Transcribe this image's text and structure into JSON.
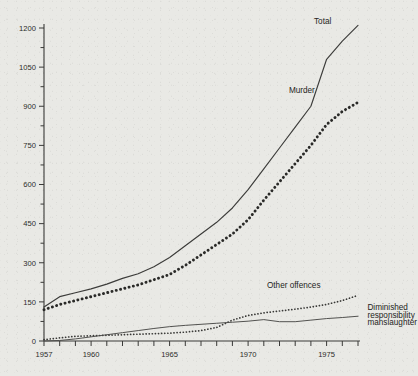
{
  "chart_data": {
    "type": "line",
    "title": "",
    "subtitle": "",
    "xlabel": "",
    "ylabel": "",
    "xlim": [
      1957,
      1977
    ],
    "ylim": [
      0,
      1200
    ],
    "grid": false,
    "legend_position": "inline-annotations",
    "y_ticks_major": [
      0,
      150,
      300,
      450,
      600,
      750,
      900,
      1050,
      1200
    ],
    "y_tick_labels": [
      "0",
      "150",
      "300",
      "450",
      "600",
      "750",
      "900",
      "1050",
      "1200"
    ],
    "y_ticks_minor": [
      75,
      225,
      375,
      525,
      675,
      825,
      975,
      1125
    ],
    "x_ticks": [
      1957,
      1958,
      1959,
      1960,
      1961,
      1962,
      1963,
      1964,
      1965,
      1966,
      1967,
      1968,
      1969,
      1970,
      1971,
      1972,
      1973,
      1974,
      1975,
      1976,
      1977
    ],
    "x_tick_labels": [
      {
        "year": 1957,
        "label": "1957"
      },
      {
        "year": 1960,
        "label": "1960"
      },
      {
        "year": 1965,
        "label": "1965"
      },
      {
        "year": 1970,
        "label": "1970"
      },
      {
        "year": 1975,
        "label": "1975"
      }
    ],
    "x": [
      1957,
      1958,
      1959,
      1960,
      1961,
      1962,
      1963,
      1964,
      1965,
      1966,
      1967,
      1968,
      1969,
      1970,
      1971,
      1972,
      1973,
      1974,
      1975,
      1976,
      1977
    ],
    "series": [
      {
        "name": "Total",
        "label": "Total",
        "style": "solid",
        "color": "#3c3c3a",
        "values": [
          130,
          170,
          185,
          200,
          218,
          240,
          258,
          285,
          320,
          365,
          410,
          455,
          510,
          580,
          660,
          740,
          820,
          900,
          1080,
          1150,
          1210
        ]
      },
      {
        "name": "Murder",
        "label": "Murder",
        "style": "thick-dotted",
        "color": "#2a2a28",
        "values": [
          120,
          140,
          155,
          170,
          185,
          200,
          215,
          235,
          255,
          290,
          330,
          370,
          410,
          465,
          540,
          610,
          680,
          750,
          830,
          880,
          915
        ]
      },
      {
        "name": "Other offences",
        "label": "Other offences",
        "style": "fine-dotted",
        "color": "#393937",
        "values": [
          5,
          12,
          18,
          20,
          22,
          24,
          26,
          28,
          30,
          34,
          40,
          52,
          80,
          98,
          108,
          115,
          122,
          130,
          140,
          155,
          175
        ]
      },
      {
        "name": "Diminished responsibility manslaughter",
        "label": "Diminished responsibility manslaughter",
        "label_lines": [
          "Diminished",
          "responsibility",
          "manslaughter"
        ],
        "style": "thin-solid",
        "color": "#4a4a48",
        "values": [
          0,
          2,
          8,
          16,
          24,
          32,
          40,
          48,
          55,
          60,
          64,
          68,
          72,
          76,
          82,
          74,
          74,
          80,
          86,
          90,
          95
        ]
      }
    ],
    "annotations": [
      {
        "text": "Total",
        "x": 1974.2,
        "y": 1215
      },
      {
        "text": "Murder",
        "x": 1972.6,
        "y": 950
      },
      {
        "text": "Other offences",
        "x": 1971.2,
        "y": 205
      },
      {
        "text": "Diminished",
        "x": 1977.6,
        "y": 120
      },
      {
        "text": "responsibility",
        "x": 1977.6,
        "y": 90
      },
      {
        "text": "manslaughter",
        "x": 1977.6,
        "y": 60
      }
    ]
  },
  "colors": {
    "background": "#e9e9e5",
    "ink": "#2c2c2a",
    "axis": "#3a3a38"
  }
}
